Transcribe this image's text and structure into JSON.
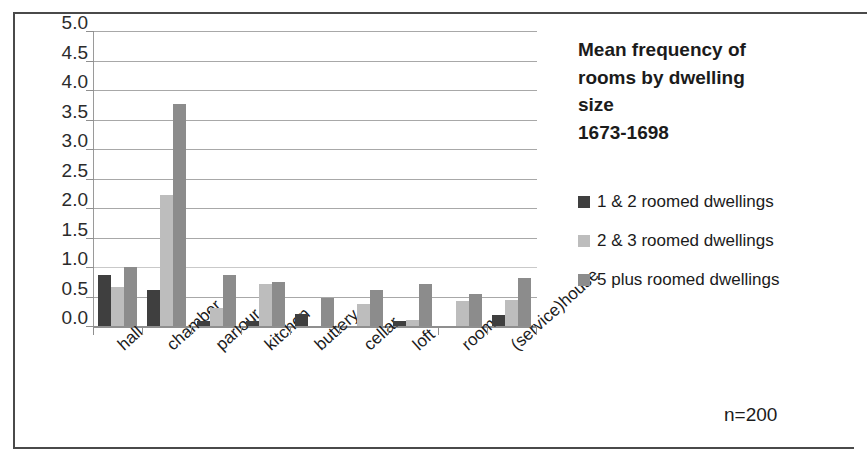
{
  "title": {
    "line1": "Mean frequency of",
    "line2": "rooms by dwelling",
    "line3": "size",
    "line4": "1673-1698"
  },
  "sample_note": "n=200",
  "colors": {
    "series_1": "#3f3f3f",
    "series_2": "#bdbdbd",
    "series_3": "#8c8c8c",
    "gridline": "#a8a8a8",
    "axis": "#8f8f8f",
    "text": "#1b1b1b",
    "frame": "#4a4a4a"
  },
  "chart_data": {
    "type": "bar",
    "title": "Mean frequency of rooms by dwelling size 1673-1698",
    "subtitle": "n=200",
    "xlabel": "",
    "ylabel": "",
    "ylim": [
      0.0,
      5.0
    ],
    "ytick_labels": [
      "5.0",
      "4.5",
      "4.0",
      "3.5",
      "3.0",
      "2.5",
      "2.0",
      "1.5",
      "1.0",
      "0.5",
      "0.0"
    ],
    "ytick_values": [
      5.0,
      4.5,
      4.0,
      3.5,
      3.0,
      2.5,
      2.0,
      1.5,
      1.0,
      0.5,
      0.0
    ],
    "grid": true,
    "legend_position": "right",
    "categories": [
      "hall",
      "chamber",
      "parlour",
      "kitchen",
      "buttery",
      "cellar",
      "loft",
      "room",
      "(service)house"
    ],
    "series": [
      {
        "name": "1 & 2 roomed dwellings",
        "color": "#3f3f3f",
        "values": [
          0.87,
          0.61,
          0.09,
          0.09,
          0.21,
          0.0,
          0.09,
          0.0,
          0.19
        ]
      },
      {
        "name": "2 & 3 roomed dwellings",
        "color": "#bdbdbd",
        "values": [
          0.66,
          2.22,
          0.31,
          0.72,
          0.0,
          0.38,
          0.11,
          0.43,
          0.44
        ]
      },
      {
        "name": "5 plus roomed dwellings",
        "color": "#8c8c8c",
        "values": [
          1.0,
          3.77,
          0.87,
          0.75,
          0.47,
          0.61,
          0.71,
          0.55,
          0.81
        ]
      }
    ]
  }
}
